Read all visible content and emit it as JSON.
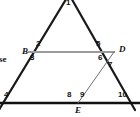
{
  "figure": {
    "canvas": {
      "width": 140,
      "height": 117,
      "background": "#ffffff"
    },
    "colors": {
      "outline": "#1a1a1a",
      "baseline": "#111111",
      "segment_bd": "#9a9a9a",
      "segment_de": "#6e6e6e",
      "label": "#111111"
    }
  },
  "vertices": [
    {
      "id": "B",
      "label": "B",
      "x": 22,
      "y": 47
    },
    {
      "id": "D",
      "label": "D",
      "x": 119,
      "y": 45
    },
    {
      "id": "E",
      "label": "E",
      "x": 75,
      "y": 106
    }
  ],
  "angle_labels": [
    {
      "id": "a1",
      "label": "1",
      "x": 66,
      "y": -1
    },
    {
      "id": "a2",
      "label": "2",
      "x": 36,
      "y": 40
    },
    {
      "id": "a3",
      "label": "3",
      "x": 30,
      "y": 54
    },
    {
      "id": "a4",
      "label": "4",
      "x": 4,
      "y": 91
    },
    {
      "id": "a5",
      "label": "5",
      "x": 96,
      "y": 40
    },
    {
      "id": "a6",
      "label": "6",
      "x": 98,
      "y": 54
    },
    {
      "id": "a7",
      "label": "7",
      "x": 108,
      "y": 61
    },
    {
      "id": "a8",
      "label": "8",
      "x": 67,
      "y": 91
    },
    {
      "id": "a9",
      "label": "9",
      "x": 80,
      "y": 91
    },
    {
      "id": "a10",
      "label": "10",
      "x": 118,
      "y": 91
    }
  ],
  "edge_text": [
    {
      "id": "left-caption",
      "label": "se",
      "x": -1,
      "y": 55
    }
  ],
  "segments": [
    {
      "id": "left-side",
      "from": [
        -6,
        118
      ],
      "to": [
        68,
        -4
      ],
      "color": "#1a1a1a",
      "width": 2.2
    },
    {
      "id": "right-side",
      "from": [
        70,
        -4
      ],
      "to": [
        135,
        110
      ],
      "color": "#1a1a1a",
      "width": 2.2
    },
    {
      "id": "base-line",
      "from": [
        -4,
        103
      ],
      "to": [
        140,
        103
      ],
      "color": "#111111",
      "width": 2.4
    },
    {
      "id": "segment-BD",
      "from": [
        28,
        52
      ],
      "to": [
        115,
        52
      ],
      "color": "#9a9a9a",
      "width": 1.8
    },
    {
      "id": "segment-DE",
      "from": [
        114,
        52
      ],
      "to": [
        78,
        103
      ],
      "color": "#6e6e6e",
      "width": 1.0
    }
  ]
}
